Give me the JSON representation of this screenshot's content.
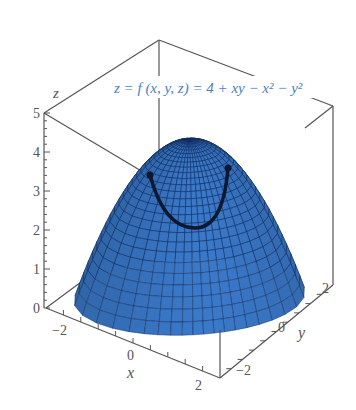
{
  "chart_data": {
    "type": "surface3d",
    "title": "z = f (x, y, z) = 4 + xy − x² − y²",
    "function": "4 + x*y - x^2 - y^2",
    "xlabel": "x",
    "ylabel": "y",
    "zlabel": "z",
    "x_ticks": [
      "−2",
      "0",
      "2"
    ],
    "y_ticks": [
      "−2",
      "0",
      "2"
    ],
    "z_ticks": [
      "0",
      "1",
      "2",
      "3",
      "4",
      "5"
    ],
    "xlim": [
      -2.5,
      2.5
    ],
    "ylim": [
      -2.5,
      2.5
    ],
    "zlim": [
      0,
      5
    ],
    "surface_color": "#3a78c8",
    "mesh_color": "#0f2a5a",
    "title_color": "#4a7fc1",
    "highlighted_curve": "dark curve on surface (constraint curve)"
  },
  "labels": {
    "title": "z = f (x, y, z) = 4 + xy − x² − y²",
    "x_axis": "x",
    "y_axis": "y",
    "z_axis": "z",
    "x_tick_neg2": "−2",
    "x_tick_0": "0",
    "x_tick_2": "2",
    "y_tick_neg2": "−2",
    "y_tick_0": "0",
    "y_tick_2": "2",
    "z_tick_0": "0",
    "z_tick_1": "1",
    "z_tick_2": "2",
    "z_tick_3": "3",
    "z_tick_4": "4",
    "z_tick_5": "5"
  }
}
